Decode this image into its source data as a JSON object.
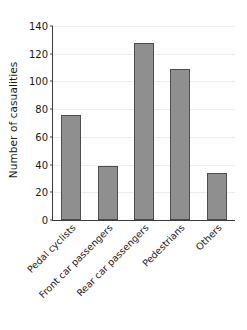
{
  "chart_data": {
    "type": "bar",
    "title": "",
    "xlabel": "",
    "ylabel": "Number of casualities",
    "categories": [
      "Pedal cyclists",
      "Front car passengers",
      "Rear car passengers",
      "Pedestrians",
      "Others"
    ],
    "values": [
      76,
      39,
      128,
      109,
      34
    ],
    "ylim": [
      0,
      140
    ],
    "yticks": [
      0,
      20,
      40,
      60,
      80,
      100,
      120,
      140
    ],
    "ytick_labels": [
      "0",
      "20",
      "40",
      "60",
      "80",
      "100",
      "120",
      "140"
    ],
    "grid": "horizontal",
    "legend": "none",
    "bar_color": "#8f8f8f",
    "bar_edge_color": "#4d4d4d",
    "grid_color": "#ececec",
    "axis_color": "#3a3a3a",
    "xtick_label_rotation": 45
  }
}
